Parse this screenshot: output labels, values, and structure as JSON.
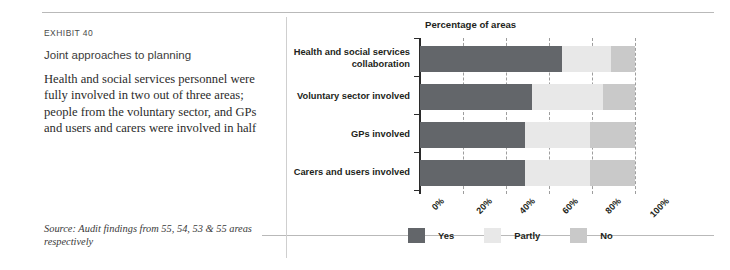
{
  "exhibit": {
    "eyebrow": "EXHIBIT 40",
    "headline": "Joint approaches to planning",
    "deck": "Health and social services personnel were fully involved in two out of three areas; people from the voluntary sector, and GPs and users and carers were involved in half",
    "source": "Source: Audit findings from 55, 54, 53 & 55 areas respectively"
  },
  "colors": {
    "yes": "#63666a",
    "partly": "#e8e8e8",
    "no": "#c9c9c9",
    "axis": "#2b2b2b",
    "grid": "#8c8c8c",
    "rule": "#b9b9b9"
  },
  "chart_data": {
    "type": "bar",
    "orientation": "horizontal",
    "stacked": true,
    "title": "Percentage of areas",
    "xlabel": "",
    "ylabel": "",
    "xlim": [
      0,
      100
    ],
    "grid": true,
    "legend_position": "bottom",
    "categories": [
      "Health and social services collaboration",
      "Voluntary sector involved",
      "GPs involved",
      "Carers and users involved"
    ],
    "series": [
      {
        "name": "Yes",
        "values": [
          66,
          52,
          49,
          49
        ]
      },
      {
        "name": "Partly",
        "values": [
          23,
          33,
          30,
          30
        ]
      },
      {
        "name": "No",
        "values": [
          11,
          15,
          21,
          21
        ]
      }
    ],
    "xticks": [
      0,
      20,
      40,
      60,
      80,
      100
    ],
    "xticklabels": [
      "0%",
      "20%",
      "40%",
      "60%",
      "80%",
      "100%"
    ]
  }
}
